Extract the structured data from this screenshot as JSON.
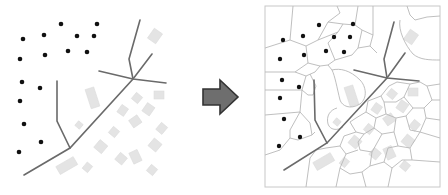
{
  "diagram": {
    "type": "before-after transformation",
    "left_panel": {
      "label": "",
      "content": "point set with road network and building footprints",
      "point_count": 16
    },
    "arrow": {
      "direction": "right",
      "fill": "#6e6e6e",
      "stroke": "#333333"
    },
    "right_panel": {
      "label": "",
      "content": "Voronoi tessellation constrained by roads and buildings",
      "frame_color": "#c8c8c8"
    },
    "colors": {
      "points": "#111111",
      "roads": "#6a6a6a",
      "buildings": "#e4e4e4",
      "cells": "#b8b8b8"
    }
  }
}
